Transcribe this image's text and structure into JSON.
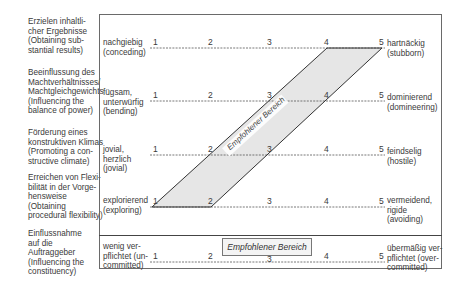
{
  "criteria": [
    {
      "label": "Erzielen inhaltli-\ncher Ergebnisse\n(Obtaining sub-\nstantial results)"
    },
    {
      "label": "Beeinflussung des\nMachtverhältnisses/\nMachtgleichgewichts\n(Influencing the\nbalance of power)"
    },
    {
      "label": "Förderung eines\nkonstruktiven Klimas\n(Promoting a con-\nstructive climate)"
    },
    {
      "label": "Erreichen von Flexi-\nbilität in der Vorge-\nhensweise\n(Obtaining\nprocedural flexibility)"
    },
    {
      "label": "Einflussnahme\nauf die\nAuftraggeber\n(Influencing the\nconstituency)"
    }
  ],
  "rows": [
    {
      "left": "nachgiebig\n(conceding)",
      "right": "hartnäckig\n(stubborn)"
    },
    {
      "left": "fügsam,\nunterwürfig\n(bending)",
      "right": "dominierend\n(domineering)"
    },
    {
      "left": "jovial,\nherzlich\n(jovial)",
      "right": "feindselig\n(hostile)"
    },
    {
      "left": "explorierend\n(exploring)",
      "right": "vermeidend,\nrigide\n(avoiding)"
    },
    {
      "left": "wenig ver-\npflichtet (un-\ncommitted)",
      "right": "übermäßig ver-\npflichtet (over-\ncommitted)"
    }
  ],
  "scale": [
    "1",
    "2",
    "3",
    "4",
    "5"
  ],
  "recommended_band_label": "Empfohlener Bereich",
  "recommended_box_label": "Empfohlener Bereich",
  "colors": {
    "band_fill": "#e6e6e6",
    "line": "#444444",
    "border": "#6a6a6a"
  }
}
